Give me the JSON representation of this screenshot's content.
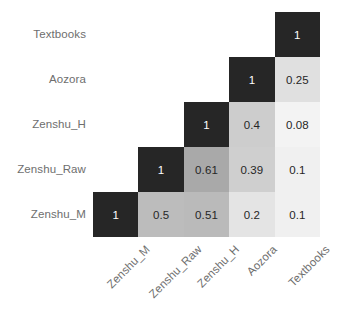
{
  "chart_data": {
    "type": "heatmap",
    "title": "",
    "xlabel": "",
    "ylabel": "",
    "grid": false,
    "legend": "none",
    "annotations": "lower-triangular correlation matrix with value labels in each cell",
    "colormap": {
      "name": "greyscale",
      "description": "dark = high correlation, light = low correlation",
      "vmin": 0,
      "vmax": 1,
      "low_color": "#ffffff",
      "high_color": "#262626"
    },
    "categories": [
      "Zenshu_M",
      "Zenshu_Raw",
      "Zenshu_H",
      "Aozora",
      "Textbooks"
    ],
    "x_tick_labels": [
      "Zenshu_M",
      "Zenshu_Raw",
      "Zenshu_H",
      "Aozora",
      "Textbooks"
    ],
    "y_tick_labels": [
      "Textbooks",
      "Aozora",
      "Zenshu_H",
      "Zenshu_Raw",
      "Zenshu_M"
    ],
    "rows": [
      {
        "label": "Textbooks",
        "cells": [
          {
            "col": "Zenshu_M",
            "value": null,
            "text": "",
            "fill": "",
            "text_color": "",
            "shown": false
          },
          {
            "col": "Zenshu_Raw",
            "value": null,
            "text": "",
            "fill": "",
            "text_color": "",
            "shown": false
          },
          {
            "col": "Zenshu_H",
            "value": null,
            "text": "",
            "fill": "",
            "text_color": "",
            "shown": false
          },
          {
            "col": "Aozora",
            "value": null,
            "text": "",
            "fill": "",
            "text_color": "",
            "shown": false
          },
          {
            "col": "Textbooks",
            "value": 1,
            "text": "1",
            "fill": "#262626",
            "text_color": "#ffffff",
            "shown": true
          }
        ]
      },
      {
        "label": "Aozora",
        "cells": [
          {
            "col": "Zenshu_M",
            "value": null,
            "text": "",
            "fill": "",
            "text_color": "",
            "shown": false
          },
          {
            "col": "Zenshu_Raw",
            "value": null,
            "text": "",
            "fill": "",
            "text_color": "",
            "shown": false
          },
          {
            "col": "Zenshu_H",
            "value": null,
            "text": "",
            "fill": "",
            "text_color": "",
            "shown": false
          },
          {
            "col": "Aozora",
            "value": 1,
            "text": "1",
            "fill": "#262626",
            "text_color": "#ffffff",
            "shown": true
          },
          {
            "col": "Textbooks",
            "value": 0.25,
            "text": "0.25",
            "fill": "#e0e0e0",
            "text_color": "#262626",
            "shown": true
          }
        ]
      },
      {
        "label": "Zenshu_H",
        "cells": [
          {
            "col": "Zenshu_M",
            "value": null,
            "text": "",
            "fill": "",
            "text_color": "",
            "shown": false
          },
          {
            "col": "Zenshu_Raw",
            "value": null,
            "text": "",
            "fill": "",
            "text_color": "",
            "shown": false
          },
          {
            "col": "Zenshu_H",
            "value": 1,
            "text": "1",
            "fill": "#262626",
            "text_color": "#ffffff",
            "shown": true
          },
          {
            "col": "Aozora",
            "value": 0.4,
            "text": "0.4",
            "fill": "#cdcdcd",
            "text_color": "#262626",
            "shown": true
          },
          {
            "col": "Textbooks",
            "value": 0.08,
            "text": "0.08",
            "fill": "#f3f3f3",
            "text_color": "#262626",
            "shown": true
          }
        ]
      },
      {
        "label": "Zenshu_Raw",
        "cells": [
          {
            "col": "Zenshu_M",
            "value": null,
            "text": "",
            "fill": "",
            "text_color": "",
            "shown": false
          },
          {
            "col": "Zenshu_Raw",
            "value": 1,
            "text": "1",
            "fill": "#262626",
            "text_color": "#ffffff",
            "shown": true
          },
          {
            "col": "Zenshu_H",
            "value": 0.61,
            "text": "0.61",
            "fill": "#a9a9a9",
            "text_color": "#262626",
            "shown": true
          },
          {
            "col": "Aozora",
            "value": 0.39,
            "text": "0.39",
            "fill": "#cfcfcf",
            "text_color": "#262626",
            "shown": true
          },
          {
            "col": "Textbooks",
            "value": 0.1,
            "text": "0.1",
            "fill": "#f0f0f0",
            "text_color": "#262626",
            "shown": true
          }
        ]
      },
      {
        "label": "Zenshu_M",
        "cells": [
          {
            "col": "Zenshu_M",
            "value": 1,
            "text": "1",
            "fill": "#262626",
            "text_color": "#ffffff",
            "shown": true
          },
          {
            "col": "Zenshu_Raw",
            "value": 0.5,
            "text": "0.5",
            "fill": "#bcbcbc",
            "text_color": "#262626",
            "shown": true
          },
          {
            "col": "Zenshu_H",
            "value": 0.51,
            "text": "0.51",
            "fill": "#bababa",
            "text_color": "#262626",
            "shown": true
          },
          {
            "col": "Aozora",
            "value": 0.2,
            "text": "0.2",
            "fill": "#e4e4e4",
            "text_color": "#262626",
            "shown": true
          },
          {
            "col": "Textbooks",
            "value": 0.1,
            "text": "0.1",
            "fill": "#f0f0f0",
            "text_color": "#262626",
            "shown": true
          }
        ]
      }
    ]
  },
  "axis_style": {
    "tick_label_color": "#6e6e6e",
    "x_tick_rotation_deg": -45
  }
}
